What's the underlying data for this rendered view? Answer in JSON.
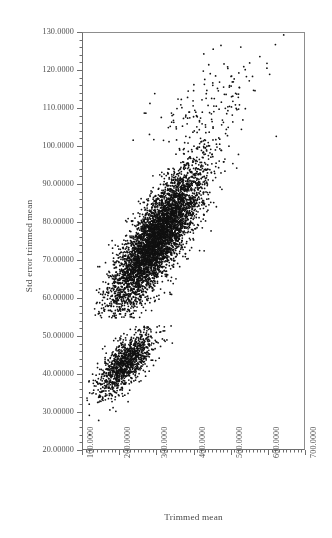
{
  "chart_data": {
    "type": "scatter",
    "title": "",
    "xlabel": "Trimmed mean",
    "ylabel": "Std error trimmed mean",
    "xlim": [
      100,
      700
    ],
    "ylim": [
      20,
      130
    ],
    "grid": false,
    "legend": null,
    "marker": {
      "shape": "dot",
      "color": "#111111",
      "size_px": 1.6
    },
    "x_ticks": [
      100,
      200,
      300,
      400,
      500,
      600,
      700
    ],
    "y_ticks": [
      20,
      30,
      40,
      50,
      60,
      70,
      80,
      90,
      100,
      110,
      120,
      130
    ],
    "x_tick_labels": [
      "100.0000",
      "200.0000",
      "300.0000",
      "400.0000",
      "500.0000",
      "600.0000",
      "700.0000"
    ],
    "y_tick_labels": [
      "20.00000",
      "30.00000",
      "40.00000",
      "50.00000",
      "60.00000",
      "70.00000",
      "80.00000",
      "90.00000",
      "100.0000",
      "110.0000",
      "120.0000",
      "130.0000"
    ],
    "x_minor_ticks_per_interval": 10,
    "y_minor_ticks_per_interval": 5,
    "x_tick_label_rotation_deg": -90,
    "n_points_approx": 6500,
    "clusters": [
      {
        "name": "upper-cluster",
        "n_points": 5200,
        "x_range": [
          130,
          600
        ],
        "y_range": [
          55,
          125
        ],
        "x_center": 300,
        "y_center": 76,
        "x_spread": 62,
        "y_spread": 9.5,
        "correlation": 0.82,
        "comment": "Main elongated cloud rising from (140,57) to (560,120); very dense core between x=200-400 and y=60-90."
      },
      {
        "name": "lower-cluster",
        "n_points": 1150,
        "x_range": [
          110,
          360
        ],
        "y_range": [
          24,
          53
        ],
        "x_center": 215,
        "y_center": 43,
        "x_spread": 38,
        "y_spread": 4.2,
        "correlation": 0.68,
        "comment": "Smaller detached cloud centred near (215,43), tapering toward (120,26) at lower left."
      },
      {
        "name": "upper-outliers",
        "n_points": 150,
        "x_range": [
          250,
          640
        ],
        "y_range": [
          100,
          130
        ],
        "x_center": 440,
        "y_center": 112,
        "x_spread": 75,
        "y_spread": 6,
        "correlation": 0.55,
        "comment": "Sparse high-value points, including an extreme point near (640,129.5)."
      }
    ],
    "notable_points": [
      {
        "x": 640,
        "y": 129.5,
        "note": "extreme top-right outlier"
      },
      {
        "x": 425,
        "y": 124.5,
        "note": "high outlier"
      },
      {
        "x": 235,
        "y": 101.8,
        "note": "isolated left high point"
      },
      {
        "x": 218,
        "y": 80.3,
        "note": "isolated left point"
      },
      {
        "x": 222,
        "y": 70.1,
        "note": "isolated left point"
      },
      {
        "x": 193,
        "y": 57.3,
        "note": "lower-left edge of main cloud"
      },
      {
        "x": 118,
        "y": 24.3,
        "note": "lowest point of lower cluster"
      },
      {
        "x": 620,
        "y": 102.8,
        "note": "far right point"
      },
      {
        "x": 337,
        "y": 52.9,
        "note": "top of lower cluster"
      }
    ]
  },
  "axes": {
    "x_title": "Trimmed mean",
    "y_title": "Std error trimmed mean"
  },
  "style": {
    "background": "#ffffff",
    "point_color": "#111111",
    "axis_color": "#6e6e6e",
    "frame_color": "#8d8d8d",
    "text_color": "#4a4a4a"
  }
}
